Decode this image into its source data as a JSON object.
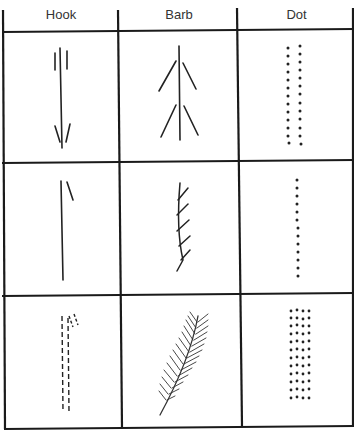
{
  "table": {
    "columns": [
      {
        "label": "Hook"
      },
      {
        "label": "Barb"
      },
      {
        "label": "Dot"
      }
    ],
    "rows": [
      {
        "cells": [
          "hook-simple",
          "barb-simple",
          "dot-double-column"
        ]
      },
      {
        "cells": [
          "hook-single",
          "barb-curved",
          "dot-single-column"
        ]
      },
      {
        "cells": [
          "hook-dashed",
          "barb-feathered",
          "dot-dense-block"
        ]
      }
    ]
  },
  "colors": {
    "line": "#1a1a1a",
    "background": "#ffffff",
    "text": "#333333"
  }
}
